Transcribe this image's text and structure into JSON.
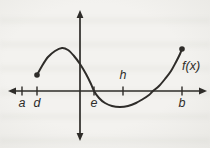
{
  "figure": {
    "background_color": "#f1f0ed",
    "ink_color": "#2e2c29",
    "function_label": "f(x)"
  },
  "chart_data": {
    "type": "line",
    "title": "",
    "xlabel": "",
    "ylabel": "",
    "grid": false,
    "legend": false,
    "axis_numbers_shown": false,
    "key_features": "Continuous curve f(x) drawn on closed interval [d, b] with filled endpoint dots; positive local maximum between d and the y-axis, zero crossing at e, negative local minimum near h, second zero crossing between h and b, positive value at b",
    "axes": {
      "x_axis_y_px": 91,
      "y_axis_x_px": 80,
      "x_axis_span_px": [
        8,
        207
      ],
      "y_axis_span_px": [
        10,
        141
      ],
      "arrowheads": [
        "left",
        "right",
        "up",
        "down"
      ]
    },
    "x_ticks": [
      {
        "label": "a",
        "x_px": 22,
        "label_side": "below"
      },
      {
        "label": "d",
        "x_px": 37,
        "label_side": "below"
      },
      {
        "label": "e",
        "x_px": 94,
        "label_side": "below"
      },
      {
        "label": "h",
        "x_px": 123,
        "label_side": "above"
      },
      {
        "label": "b",
        "x_px": 182,
        "label_side": "below"
      }
    ],
    "series": [
      {
        "name": "f(x)",
        "endpoint_markers": "filled-dot",
        "endpoint_radius_px": 2.8,
        "points_px": [
          [
            37,
            75
          ],
          [
            42,
            66
          ],
          [
            48,
            57
          ],
          [
            55,
            51
          ],
          [
            62,
            48
          ],
          [
            68,
            50
          ],
          [
            74,
            56
          ],
          [
            80,
            64
          ],
          [
            86,
            74
          ],
          [
            91,
            84
          ],
          [
            94,
            91
          ],
          [
            99,
            98
          ],
          [
            105,
            103
          ],
          [
            112,
            106
          ],
          [
            120,
            107
          ],
          [
            128,
            106
          ],
          [
            136,
            103
          ],
          [
            143,
            99
          ],
          [
            149,
            95
          ],
          [
            153,
            91
          ],
          [
            159,
            86
          ],
          [
            165,
            79
          ],
          [
            171,
            71
          ],
          [
            176,
            62
          ],
          [
            180,
            54
          ],
          [
            182,
            49
          ]
        ]
      }
    ],
    "annotations": [
      {
        "text": "f(x)",
        "x_px": 182,
        "y_px": 70,
        "anchor": "start",
        "style": "italic"
      }
    ]
  }
}
